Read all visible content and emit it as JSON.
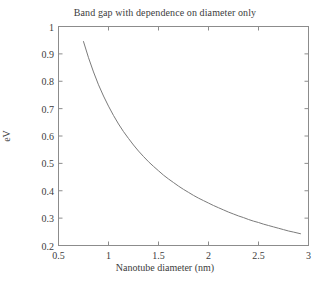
{
  "chart_data": {
    "type": "line",
    "title": "Band gap with dependence on diameter only",
    "xlabel": "Nanotube diameter (nm)",
    "ylabel": "eV",
    "xlim": [
      0.5,
      3
    ],
    "ylim": [
      0.2,
      1
    ],
    "grid": false,
    "legend": "none",
    "line_color": "#7b7b7b",
    "axis_color": "#8c8c8c",
    "background_color": "#ffffff",
    "xticks": [
      0.5,
      1,
      1.5,
      2,
      2.5,
      3
    ],
    "xtick_labels": [
      "0.5",
      "1",
      "1.5",
      "2",
      "2.5",
      "3"
    ],
    "yticks": [
      0.2,
      0.3,
      0.4,
      0.5,
      0.6,
      0.7,
      0.8,
      0.9,
      1
    ],
    "ytick_labels": [
      "0.2",
      "0.3",
      "0.4",
      "0.5",
      "0.6",
      "0.7",
      "0.8",
      "0.9",
      "1"
    ],
    "series": [
      {
        "name": "Band gap",
        "x": [
          0.75,
          0.8,
          0.85,
          0.9,
          0.95,
          1.0,
          1.05,
          1.1,
          1.15,
          1.2,
          1.25,
          1.3,
          1.35,
          1.4,
          1.45,
          1.5,
          1.55,
          1.6,
          1.65,
          1.7,
          1.75,
          1.8,
          1.85,
          1.9,
          1.95,
          2.0,
          2.05,
          2.1,
          2.15,
          2.2,
          2.25,
          2.3,
          2.35,
          2.4,
          2.45,
          2.5,
          2.55,
          2.6,
          2.65,
          2.7,
          2.75,
          2.8,
          2.85,
          2.92
        ],
        "y": [
          0.945,
          0.886,
          0.834,
          0.787,
          0.746,
          0.709,
          0.675,
          0.644,
          0.616,
          0.591,
          0.567,
          0.545,
          0.525,
          0.506,
          0.489,
          0.473,
          0.457,
          0.443,
          0.43,
          0.417,
          0.405,
          0.394,
          0.383,
          0.373,
          0.364,
          0.355,
          0.346,
          0.338,
          0.33,
          0.322,
          0.315,
          0.308,
          0.302,
          0.295,
          0.289,
          0.284,
          0.278,
          0.273,
          0.268,
          0.263,
          0.258,
          0.253,
          0.249,
          0.243
        ]
      }
    ]
  }
}
